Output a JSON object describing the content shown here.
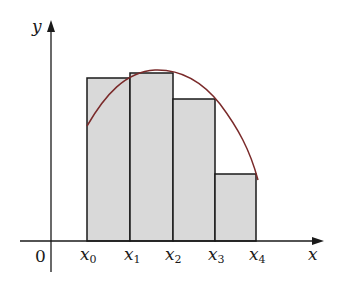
{
  "diagram": {
    "axes": {
      "x_label": "x",
      "y_label": "y",
      "origin_label": "0"
    },
    "ticks": [
      {
        "base": "x",
        "sub": "0"
      },
      {
        "base": "x",
        "sub": "1"
      },
      {
        "base": "x",
        "sub": "2"
      },
      {
        "base": "x",
        "sub": "3"
      },
      {
        "base": "x",
        "sub": "4"
      }
    ],
    "rectangles": [
      {
        "from": "x0",
        "to": "x1",
        "relative_height": 0.88
      },
      {
        "from": "x1",
        "to": "x2",
        "relative_height": 0.92
      },
      {
        "from": "x2",
        "to": "x3",
        "relative_height": 0.79
      },
      {
        "from": "x3",
        "to": "x4",
        "relative_height": 0.38
      }
    ],
    "colors": {
      "rect_fill": "#d9d9d9",
      "curve": "#7a2a2a",
      "axis": "#1a1a1a"
    }
  }
}
